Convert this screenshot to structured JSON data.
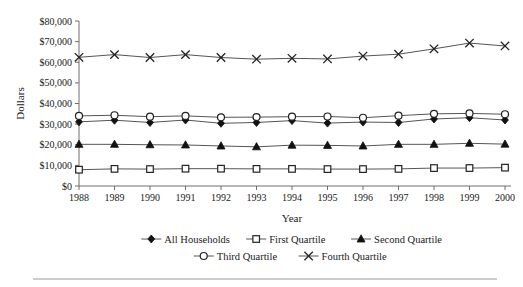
{
  "chart_data": {
    "type": "line",
    "title": "",
    "xlabel": "Year",
    "ylabel": "Dollars",
    "grid": false,
    "legend_position": "bottom",
    "categories": [
      1988,
      1989,
      1990,
      1991,
      1992,
      1993,
      1994,
      1995,
      1996,
      1997,
      1998,
      1999,
      2000
    ],
    "x": [
      "1988",
      "1989",
      "1990",
      "1991",
      "1992",
      "1993",
      "1994",
      "1995",
      "1996",
      "1997",
      "1998",
      "1999",
      "2000"
    ],
    "ylim": [
      0,
      80000
    ],
    "ytick_values": [
      0,
      10000,
      20000,
      30000,
      40000,
      50000,
      60000,
      70000,
      80000
    ],
    "ytick_labels": [
      "$0",
      "$10,000",
      "$20,000",
      "$30,000",
      "$40,000",
      "$50,000",
      "$60,000",
      "$70,000",
      "$80,000"
    ],
    "series": [
      {
        "name": "All Households",
        "marker": "filled-diamond",
        "values": [
          31100,
          31900,
          30800,
          32000,
          30400,
          30800,
          31700,
          30500,
          31000,
          30800,
          32500,
          33100,
          32000
        ]
      },
      {
        "name": "First Quartile",
        "marker": "open-square",
        "values": [
          7900,
          8300,
          8200,
          8400,
          8400,
          8300,
          8300,
          8200,
          8200,
          8300,
          8700,
          8700,
          8900
        ]
      },
      {
        "name": "Second Quartile",
        "marker": "filled-triangle",
        "values": [
          20200,
          20200,
          20000,
          19900,
          19400,
          19000,
          19800,
          19700,
          19400,
          20200,
          20200,
          20700,
          20300
        ]
      },
      {
        "name": "Third Quartile",
        "marker": "open-circle",
        "values": [
          34000,
          34300,
          33600,
          34000,
          33300,
          33400,
          33600,
          33700,
          33100,
          34100,
          35000,
          35200,
          34800
        ]
      },
      {
        "name": "Fourth Quartile",
        "marker": "cross-x",
        "values": [
          62400,
          63700,
          62300,
          63700,
          62300,
          61500,
          61900,
          61600,
          63000,
          63900,
          66500,
          69300,
          67900
        ]
      }
    ]
  },
  "legend": {
    "row1": [
      "All Households",
      "First Quartile",
      "Second Quartile"
    ],
    "row2": [
      "Third Quartile",
      "Fourth Quartile"
    ]
  },
  "colors": {
    "line": "#555555",
    "axis": "#6e6e6e",
    "text": "#1a1a1a",
    "marker_fill_solid": "#111111",
    "marker_fill_open": "#ffffff",
    "rule": "#9a9a9a"
  }
}
